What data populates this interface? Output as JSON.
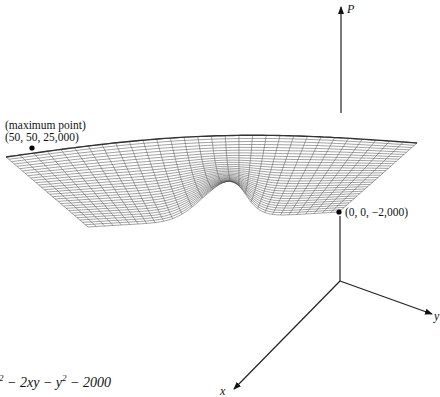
{
  "figure": {
    "axes": {
      "p_label": "P",
      "x_label": "x",
      "y_label": "y",
      "origin": [
        340,
        281
      ],
      "p_end": [
        341,
        6
      ],
      "x_end": [
        232,
        390
      ],
      "y_end": [
        432,
        315
      ]
    },
    "points": {
      "maximum": {
        "title": "(maximum point)",
        "coords": "(50, 50, 25,000)",
        "pos": [
          32,
          148
        ]
      },
      "minimum_corner": {
        "coords": "(0, 0, −2,000)",
        "pos": [
          339,
          212
        ]
      }
    },
    "surface": {
      "corner_far_left": [
        6,
        157
      ],
      "corner_far_right": [
        417,
        143
      ],
      "corner_near_left": [
        88,
        227
      ],
      "corner_near_right": [
        339,
        212
      ],
      "mesh_color": "#555555",
      "grid_divisions": 30
    },
    "formula": {
      "visible_text_prefix": "2",
      "visible_text": " − 2xy − y",
      "sup2": "2",
      "tail": " − 2000"
    }
  }
}
